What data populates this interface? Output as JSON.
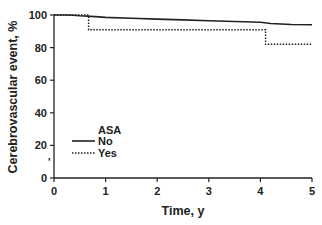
{
  "chart_data": {
    "type": "line",
    "title": "",
    "xlabel": "Time, y",
    "ylabel": "Cerebrovascular event, %",
    "xlim": [
      0,
      5
    ],
    "ylim": [
      0,
      100
    ],
    "x_ticks": [
      "0",
      "1",
      "2",
      "3",
      "4",
      "5"
    ],
    "y_ticks": [
      "0",
      "20",
      "40",
      "60",
      "80",
      "100"
    ],
    "grid": false,
    "legend": {
      "title": "ASA",
      "position": "lower-left",
      "entries": [
        "No",
        "Yes"
      ]
    },
    "series": [
      {
        "name": "No",
        "style": "solid",
        "step": true,
        "points": [
          [
            0,
            100
          ],
          [
            0.3,
            100
          ],
          [
            0.5,
            99.5
          ],
          [
            0.8,
            99
          ],
          [
            1.0,
            98.5
          ],
          [
            1.5,
            98
          ],
          [
            2.0,
            97.5
          ],
          [
            2.5,
            97
          ],
          [
            3.0,
            96.5
          ],
          [
            3.5,
            96
          ],
          [
            4.0,
            95.5
          ],
          [
            4.2,
            94.8
          ],
          [
            4.6,
            94.2
          ],
          [
            5.0,
            94
          ]
        ]
      },
      {
        "name": "Yes",
        "style": "dotted",
        "step": true,
        "points": [
          [
            0,
            100
          ],
          [
            0.67,
            100
          ],
          [
            0.67,
            91
          ],
          [
            4.1,
            91
          ],
          [
            4.1,
            82
          ],
          [
            5.0,
            82
          ]
        ]
      }
    ],
    "annotations": [
      "'"
    ]
  },
  "colors": {
    "line": "#222222",
    "axis": "#222222",
    "background": "#ffffff"
  }
}
